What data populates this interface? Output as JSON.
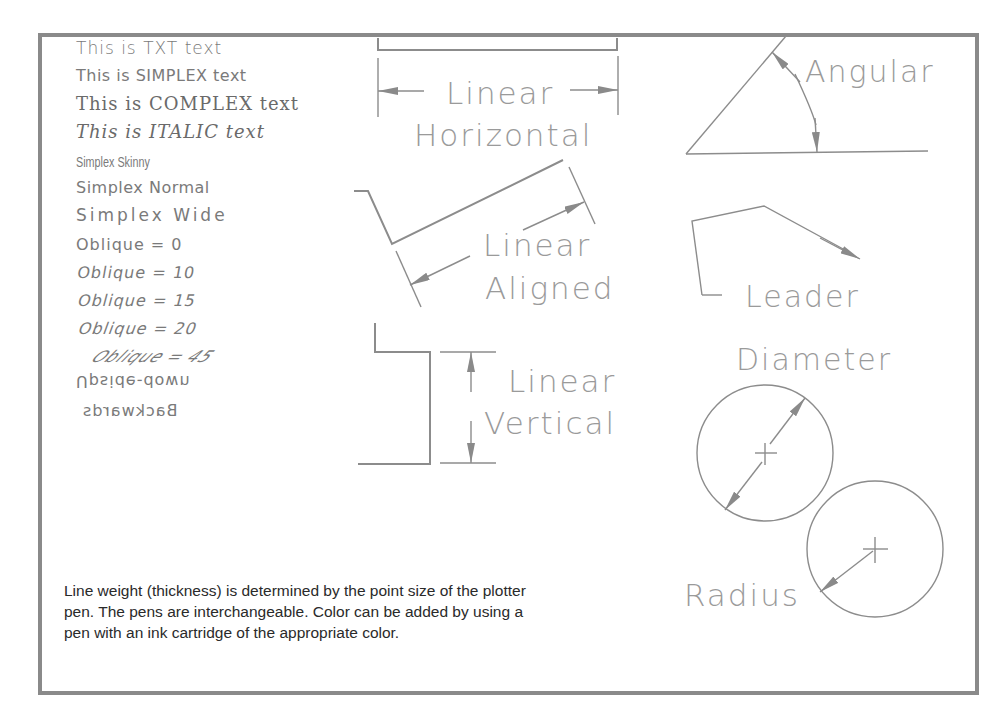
{
  "figure": {
    "font_samples": [
      {
        "id": "txt",
        "label": "This is TXT text"
      },
      {
        "id": "simplex",
        "label": "This is SIMPLEX text"
      },
      {
        "id": "complex",
        "label": "This is COMPLEX text"
      },
      {
        "id": "italic",
        "label": "This is ITALIC text"
      },
      {
        "id": "skinny",
        "label": "Simplex Skinny"
      },
      {
        "id": "normal",
        "label": "Simplex Normal"
      },
      {
        "id": "wide",
        "label": "Simplex Wide"
      },
      {
        "id": "oblique0",
        "label": "Oblique = 0"
      },
      {
        "id": "oblique10",
        "label": "Oblique = 10"
      },
      {
        "id": "oblique15",
        "label": "Oblique = 15"
      },
      {
        "id": "oblique20",
        "label": "Oblique = 20"
      },
      {
        "id": "oblique45",
        "label": "Oblique = 45"
      },
      {
        "id": "upside_down",
        "label": "Upside-down"
      },
      {
        "id": "backwards",
        "label": "Backwards"
      }
    ],
    "dimension_labels": {
      "linear_horizontal_1": "Linear",
      "linear_horizontal_2": "Horizontal",
      "linear_aligned_1": "Linear",
      "linear_aligned_2": "Aligned",
      "linear_vertical_1": "Linear",
      "linear_vertical_2": "Vertical",
      "angular": "Angular",
      "leader": "Leader",
      "diameter": "Diameter",
      "radius": "Radius"
    },
    "caption": "Line weight (thickness) is determined by the point size of the plotter pen. The pens are interchangeable. Color can be added by using a pen with an ink cartridge of the appropriate color.",
    "colors": {
      "frame": "#8a8a8a",
      "line": "#8c8c8c",
      "text": "#7a7a7a",
      "caption": "#2a2a2a"
    }
  }
}
